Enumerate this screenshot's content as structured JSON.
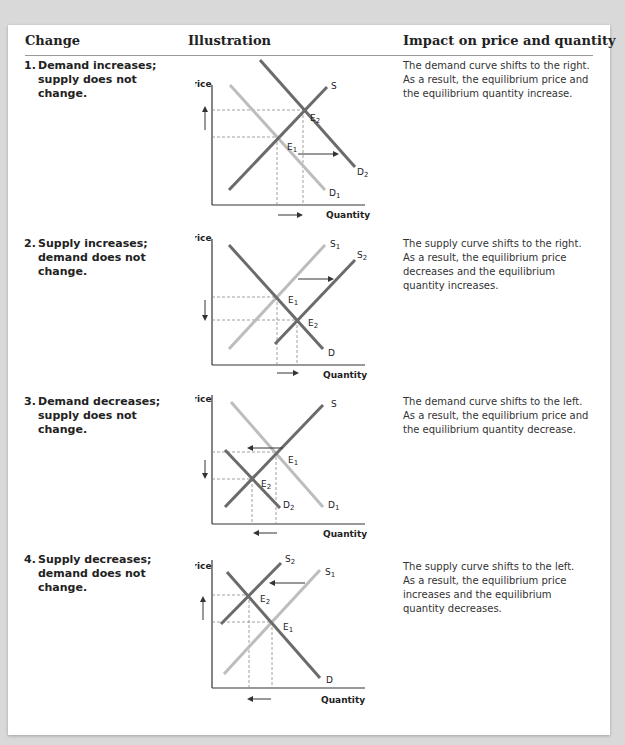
{
  "header": {
    "change": "Change",
    "illustration": "Illustration",
    "impact": "Impact on price and quantity"
  },
  "axes": {
    "price": "Price",
    "quantity": "Quantity"
  },
  "rows": [
    {
      "num": "1.",
      "change": [
        "Demand increases;",
        "supply does not",
        "change."
      ],
      "impact": [
        "The demand curve shifts to the right.",
        "As a result, the equilibrium price and",
        "the equilibrium quantity increase."
      ],
      "labels": {
        "s": "S",
        "d1": "D",
        "d1_sub": "1",
        "d2": "D",
        "d2_sub": "2",
        "e1": "E",
        "e1_sub": "1",
        "e2": "E",
        "e2_sub": "2"
      }
    },
    {
      "num": "2.",
      "change": [
        "Supply increases;",
        "demand does not",
        "change."
      ],
      "impact": [
        "The supply curve shifts to the right.",
        "As a result, the equilibrium price",
        "decreases and the equilibrium",
        "quantity increases."
      ],
      "labels": {
        "s1": "S",
        "s1_sub": "1",
        "s2": "S",
        "s2_sub": "2",
        "d": "D",
        "e1": "E",
        "e1_sub": "1",
        "e2": "E",
        "e2_sub": "2"
      }
    },
    {
      "num": "3.",
      "change": [
        "Demand decreases;",
        "supply does not",
        "change."
      ],
      "impact": [
        "The demand curve shifts to the left.",
        "As a result, the equilibrium price and",
        "the equilibrium quantity decrease."
      ],
      "labels": {
        "s": "S",
        "d1": "D",
        "d1_sub": "1",
        "d2": "D",
        "d2_sub": "2",
        "e1": "E",
        "e1_sub": "1",
        "e2": "E",
        "e2_sub": "2"
      }
    },
    {
      "num": "4.",
      "change": [
        "Supply decreases;",
        "demand does not",
        "change."
      ],
      "impact": [
        "The supply curve shifts to the left.",
        "As a result, the equilibrium price",
        "increases and the equilibrium",
        "quantity decreases."
      ],
      "labels": {
        "s1": "S",
        "s1_sub": "1",
        "s2": "S",
        "s2_sub": "2",
        "d": "D",
        "e1": "E",
        "e1_sub": "1",
        "e2": "E",
        "e2_sub": "2"
      }
    }
  ],
  "colors": {
    "dark_curve": "#6b6b6b",
    "light_curve": "#bdbdbd",
    "axis": "#333333",
    "dash": "#888888"
  }
}
